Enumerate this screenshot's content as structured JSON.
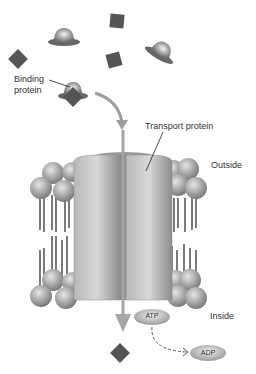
{
  "labels": {
    "binding_protein_line1": "Binding",
    "binding_protein_line2": "protein",
    "transport_protein": "Transport protein",
    "outside": "Outside",
    "inside": "Inside",
    "atp": "ATP",
    "adp": "ADP"
  },
  "colors": {
    "substrate": "#555555",
    "protein": "#9a9a9a",
    "arrow": "#9e9e9e",
    "text": "#333333"
  }
}
